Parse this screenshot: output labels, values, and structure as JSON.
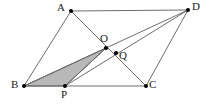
{
  "figure": {
    "type": "geometry-diagram",
    "width": 217,
    "height": 105,
    "background_color": "#ffffff",
    "line_color": "#6e6e6e",
    "shade_fill_color": "#b8b8b8",
    "shade_stroke_color": "#5a5a5a",
    "label_color": "#1a1a1a",
    "points": [
      {
        "id": "A",
        "label": "A",
        "x": 71,
        "y": 11,
        "label_x": 57,
        "label_y": 2,
        "dot": true
      },
      {
        "id": "D",
        "label": "D",
        "x": 188,
        "y": 10,
        "label_x": 192,
        "label_y": 1,
        "dot": true
      },
      {
        "id": "B",
        "label": "B",
        "x": 24,
        "y": 86,
        "label_x": 11,
        "label_y": 79,
        "dot": true
      },
      {
        "id": "C",
        "label": "C",
        "x": 146,
        "y": 86,
        "label_x": 149,
        "label_y": 79,
        "dot": true
      },
      {
        "id": "O",
        "label": "O",
        "x": 106,
        "y": 48,
        "label_x": 100,
        "label_y": 33,
        "dot": true
      },
      {
        "id": "Q",
        "label": "Q",
        "x": 116,
        "y": 53,
        "label_x": 119,
        "label_y": 50,
        "dot": true
      },
      {
        "id": "P",
        "label": "P",
        "x": 65,
        "y": 86,
        "label_x": 61,
        "label_y": 89,
        "dot": true
      }
    ],
    "segments": [
      {
        "name": "segment-AD",
        "from": "A",
        "to": "D",
        "kind": "edge"
      },
      {
        "name": "segment-AB",
        "from": "A",
        "to": "B",
        "kind": "edge"
      },
      {
        "name": "segment-BC",
        "from": "B",
        "to": "C",
        "kind": "edge"
      },
      {
        "name": "segment-CD",
        "from": "C",
        "to": "D",
        "kind": "edge"
      },
      {
        "name": "segment-AC",
        "from": "A",
        "to": "C",
        "kind": "cevian"
      },
      {
        "name": "segment-BD",
        "from": "B",
        "to": "D",
        "kind": "cevian"
      },
      {
        "name": "segment-PD",
        "from": "P",
        "to": "D",
        "kind": "cevian"
      },
      {
        "name": "segment-PO",
        "from": "P",
        "to": "O",
        "kind": "cevian"
      }
    ],
    "shaded_region": {
      "name": "shaded-triangle-BPO",
      "vertices": [
        "B",
        "P",
        "O"
      ]
    }
  }
}
